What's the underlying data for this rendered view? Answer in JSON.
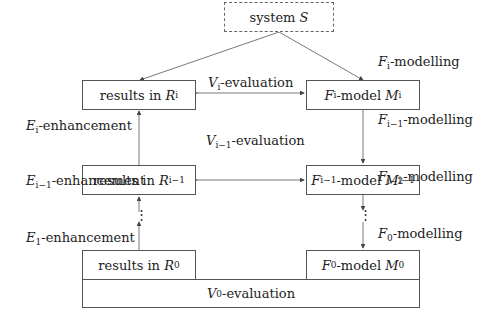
{
  "system": {
    "prefix": "system ",
    "symbol": "S"
  },
  "left_boxes": [
    {
      "prefix": "results in ",
      "symbol": "R",
      "sub": "i"
    },
    {
      "prefix": "results in ",
      "symbol": "R",
      "sub": "i−1"
    },
    {
      "prefix": "results in ",
      "symbol": "R",
      "sub": "0"
    }
  ],
  "right_boxes": [
    {
      "f": "F",
      "fsub": "i",
      "mid": "-model ",
      "m": "M",
      "msub": "i"
    },
    {
      "f": "F",
      "fsub": "i−1",
      "mid": "-model ",
      "m": "M",
      "msub": "i−1"
    },
    {
      "f": "F",
      "fsub": "0",
      "mid": "-model ",
      "m": "M",
      "msub": "0"
    }
  ],
  "evaluations": [
    {
      "symbol": "V",
      "sub": "i",
      "text": "-evaluation"
    },
    {
      "symbol": "V",
      "sub": "i−1",
      "text": "-evaluation"
    },
    {
      "symbol": "V",
      "sub": "0",
      "text": "-evaluation"
    }
  ],
  "enhancements": [
    {
      "symbol": "E",
      "sub": "i",
      "text": "-enhancement"
    },
    {
      "symbol": "E",
      "sub": "i−1",
      "text": "-enhancement"
    },
    {
      "symbol": "E",
      "sub": "1",
      "text": "-enhancement"
    }
  ],
  "modellings": [
    {
      "symbol": "F",
      "sub": "i",
      "text": "-modelling"
    },
    {
      "symbol": "F",
      "sub": "i−1",
      "text": "-modelling"
    },
    {
      "symbol": "F",
      "sub": "i−2",
      "text": "-modelling"
    },
    {
      "symbol": "F",
      "sub": "0",
      "text": "-modelling"
    }
  ],
  "ellipsis": "⋮"
}
